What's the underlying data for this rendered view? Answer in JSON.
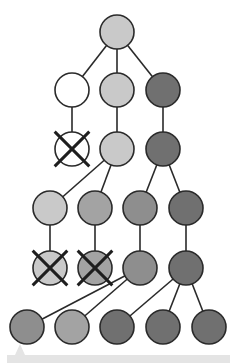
{
  "diagram": {
    "title": "",
    "radius": 17,
    "stroke": "#2a2a2a",
    "colors": {
      "white": "#ffffff",
      "light": "#c9c9c9",
      "medium": "#a3a3a3",
      "mediumdark": "#8e8e8e",
      "dark": "#707070"
    },
    "nodes": [
      {
        "id": "n0",
        "x": 117,
        "y": 32,
        "fill": "light",
        "crossed": false
      },
      {
        "id": "n1",
        "x": 72,
        "y": 90,
        "fill": "white",
        "crossed": false
      },
      {
        "id": "n2",
        "x": 117,
        "y": 90,
        "fill": "light",
        "crossed": false
      },
      {
        "id": "n3",
        "x": 163,
        "y": 90,
        "fill": "dark",
        "crossed": false
      },
      {
        "id": "n4",
        "x": 72,
        "y": 149,
        "fill": "white",
        "crossed": true
      },
      {
        "id": "n5",
        "x": 117,
        "y": 149,
        "fill": "light",
        "crossed": false
      },
      {
        "id": "n6",
        "x": 163,
        "y": 149,
        "fill": "dark",
        "crossed": false
      },
      {
        "id": "n7",
        "x": 50,
        "y": 208,
        "fill": "light",
        "crossed": false
      },
      {
        "id": "n8",
        "x": 95,
        "y": 208,
        "fill": "medium",
        "crossed": false
      },
      {
        "id": "n9",
        "x": 140,
        "y": 208,
        "fill": "mediumdark",
        "crossed": false
      },
      {
        "id": "n10",
        "x": 186,
        "y": 208,
        "fill": "dark",
        "crossed": false
      },
      {
        "id": "n11",
        "x": 50,
        "y": 268,
        "fill": "light",
        "crossed": true
      },
      {
        "id": "n12",
        "x": 95,
        "y": 268,
        "fill": "medium",
        "crossed": true
      },
      {
        "id": "n13",
        "x": 140,
        "y": 268,
        "fill": "mediumdark",
        "crossed": false
      },
      {
        "id": "n14",
        "x": 186,
        "y": 268,
        "fill": "dark",
        "crossed": false
      },
      {
        "id": "n15",
        "x": 27,
        "y": 327,
        "fill": "mediumdark",
        "crossed": false
      },
      {
        "id": "n16",
        "x": 72,
        "y": 327,
        "fill": "medium",
        "crossed": false
      },
      {
        "id": "n17",
        "x": 117,
        "y": 327,
        "fill": "dark",
        "crossed": false
      },
      {
        "id": "n18",
        "x": 163,
        "y": 327,
        "fill": "dark",
        "crossed": false
      },
      {
        "id": "n19",
        "x": 209,
        "y": 327,
        "fill": "dark",
        "crossed": false
      }
    ],
    "edges": [
      [
        "n0",
        "n1"
      ],
      [
        "n0",
        "n2"
      ],
      [
        "n0",
        "n3"
      ],
      [
        "n1",
        "n4"
      ],
      [
        "n2",
        "n5"
      ],
      [
        "n3",
        "n6"
      ],
      [
        "n5",
        "n7"
      ],
      [
        "n5",
        "n8"
      ],
      [
        "n6",
        "n9"
      ],
      [
        "n6",
        "n10"
      ],
      [
        "n7",
        "n11"
      ],
      [
        "n8",
        "n12"
      ],
      [
        "n9",
        "n13"
      ],
      [
        "n10",
        "n14"
      ],
      [
        "n13",
        "n15"
      ],
      [
        "n13",
        "n16"
      ],
      [
        "n14",
        "n17"
      ],
      [
        "n14",
        "n18"
      ],
      [
        "n14",
        "n19"
      ]
    ],
    "bottom_bar": {
      "x": 7,
      "y": 355,
      "width": 223,
      "height": 8,
      "color": "#e4e4e4",
      "pointer_x": 20,
      "pointer_top": 344
    }
  }
}
